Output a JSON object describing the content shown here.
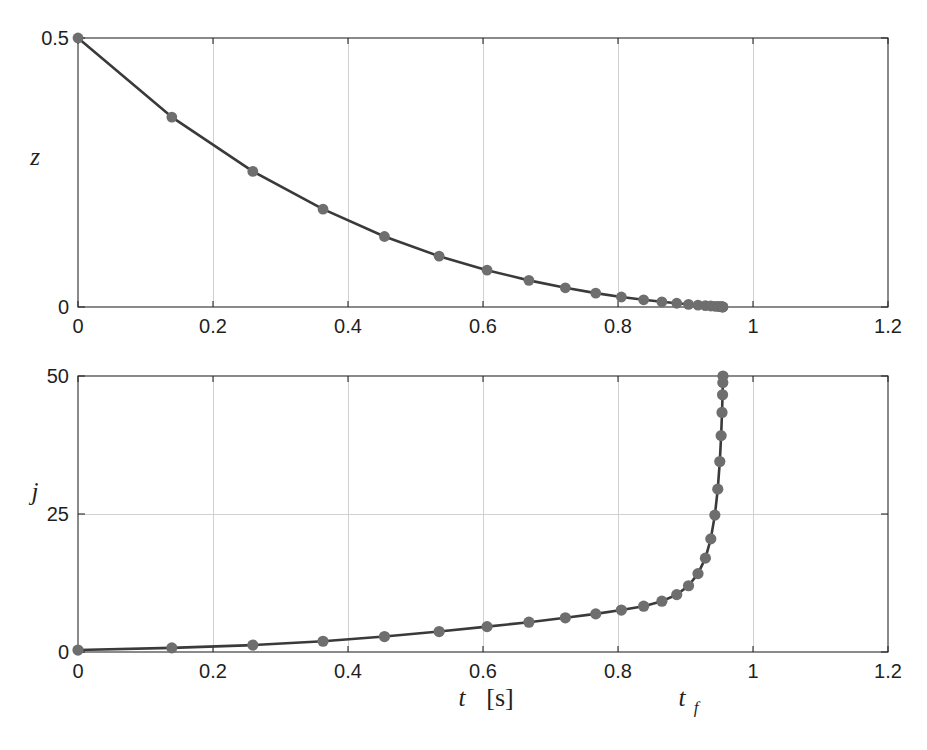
{
  "figure": {
    "background": "#ffffff",
    "line_color": "#3a3a3a",
    "marker_color": "#6e6e6e",
    "grid_color": "#c9c9c9",
    "axis_color": "#2a2a2a"
  },
  "annotations": {
    "xlabel_t": "t",
    "xlabel_unit": "[s]",
    "tf_symbol": "t",
    "tf_subscript": "f"
  },
  "chart_data": [
    {
      "type": "line",
      "id": "top-panel-z",
      "title": "",
      "xlabel": "",
      "ylabel": "z",
      "xlim": [
        0,
        1.2
      ],
      "ylim": [
        0,
        0.5
      ],
      "xticks": [
        0,
        0.2,
        0.4,
        0.6,
        0.8,
        1.0,
        1.2
      ],
      "xticklabels": [
        "0",
        "0.2",
        "0.4",
        "0.6",
        "0.8",
        "1",
        "1.2"
      ],
      "yticks": [
        0,
        0.5
      ],
      "yticklabels": [
        "0",
        "0.5"
      ],
      "grid": true,
      "legend": null,
      "markers": true,
      "series": [
        {
          "name": "z",
          "x": [
            0.0,
            0.139,
            0.259,
            0.363,
            0.454,
            0.535,
            0.606,
            0.668,
            0.722,
            0.767,
            0.805,
            0.838,
            0.865,
            0.887,
            0.9045,
            0.9185,
            0.9295,
            0.9375,
            0.9435,
            0.9478,
            0.9508,
            0.9528,
            0.9541,
            0.9549,
            0.9553,
            0.9555
          ],
          "y": [
            0.5,
            0.353,
            0.252,
            0.182,
            0.131,
            0.0945,
            0.0685,
            0.0495,
            0.0357,
            0.0258,
            0.0186,
            0.0134,
            0.0097,
            0.007,
            0.005,
            0.0036,
            0.0026,
            0.0019,
            0.0013,
            0.001,
            0.0007,
            0.0005,
            0.0003,
            0.0002,
            0.0001,
            0.0
          ]
        }
      ]
    },
    {
      "type": "line",
      "id": "bottom-panel-jdot",
      "title": "",
      "xlabel": "t [s]",
      "ylabel": "j",
      "xlim": [
        0,
        1.2
      ],
      "ylim": [
        0,
        50
      ],
      "xticks": [
        0,
        0.2,
        0.4,
        0.6,
        0.8,
        1.0,
        1.2
      ],
      "xticklabels": [
        "0",
        "0.2",
        "0.4",
        "0.6",
        "0.8",
        "1",
        "1.2"
      ],
      "yticks": [
        0,
        25,
        50
      ],
      "yticklabels": [
        "0",
        "25",
        "50"
      ],
      "grid": true,
      "legend": null,
      "markers": true,
      "annotation_tf": 0.9555,
      "series": [
        {
          "name": "jdot",
          "x": [
            0.0,
            0.139,
            0.259,
            0.363,
            0.454,
            0.535,
            0.606,
            0.668,
            0.722,
            0.767,
            0.805,
            0.838,
            0.865,
            0.887,
            0.9045,
            0.9185,
            0.9295,
            0.9375,
            0.9435,
            0.9478,
            0.9508,
            0.9528,
            0.9541,
            0.9549,
            0.9553,
            0.9555
          ],
          "y": [
            0.35,
            0.75,
            1.25,
            1.95,
            2.8,
            3.7,
            4.6,
            5.4,
            6.2,
            6.9,
            7.6,
            8.3,
            9.2,
            10.4,
            12.0,
            14.2,
            17.0,
            20.5,
            24.8,
            29.5,
            34.5,
            39.2,
            43.4,
            46.6,
            48.8,
            50.0
          ]
        }
      ]
    }
  ]
}
